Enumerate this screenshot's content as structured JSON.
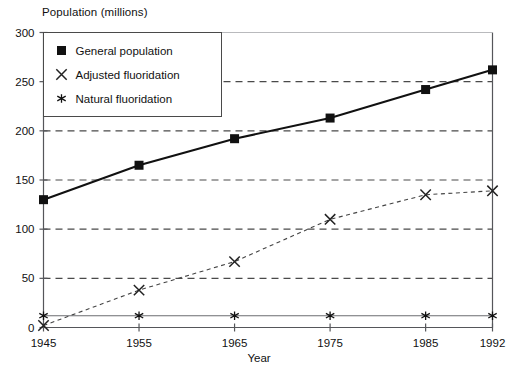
{
  "chart_data": {
    "type": "line",
    "title": "",
    "ylabel": "Population (millions)",
    "xlabel": "Year",
    "x": [
      1945,
      1955,
      1965,
      1975,
      1985,
      1992
    ],
    "categories": [
      "1945",
      "1955",
      "1965",
      "1975",
      "1985",
      "1992"
    ],
    "xtick_labels": [
      "1945",
      "1955",
      "1965",
      "1975",
      "1985",
      "1992"
    ],
    "ytick_labels": [
      "0",
      "50",
      "100",
      "150",
      "200",
      "250",
      "300"
    ],
    "ytick_values": [
      0,
      50,
      100,
      150,
      200,
      250,
      300
    ],
    "ylim": [
      0,
      300
    ],
    "xlim": [
      1945,
      1992
    ],
    "grid": "horizontal-dashed",
    "legend_position": "top-left-inside",
    "series": [
      {
        "name": "General population",
        "marker": "square",
        "line_style": "solid",
        "color": "#111111",
        "values": [
          130,
          165,
          192,
          213,
          242,
          262
        ]
      },
      {
        "name": "Adjusted fluoridation",
        "marker": "x",
        "line_style": "dashed",
        "color": "#444444",
        "values": [
          2,
          38,
          67,
          110,
          135,
          139
        ]
      },
      {
        "name": "Natural fluoridation",
        "marker": "star",
        "line_style": "solid-thin",
        "color": "#6b6c70",
        "values": [
          12,
          12,
          12,
          12,
          12,
          12
        ]
      }
    ]
  },
  "legend": {
    "items": [
      {
        "label": "General population",
        "marker": "square"
      },
      {
        "label": "Adjusted fluoridation",
        "marker": "x"
      },
      {
        "label": "Natural fluoridation",
        "marker": "star"
      }
    ]
  },
  "axes": {
    "y_title": "Population (millions)",
    "x_title": "Year"
  }
}
